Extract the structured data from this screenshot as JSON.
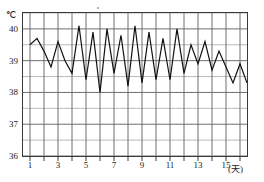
{
  "chart_data": {
    "type": "line",
    "title": "",
    "xlabel": "(天)",
    "ylabel": "℃",
    "x": [
      1,
      1.5,
      2,
      2.5,
      3,
      3.5,
      4,
      4.5,
      5,
      5.5,
      6,
      6.5,
      7,
      7.5,
      8,
      8.5,
      9,
      9.5,
      10,
      10.5,
      11,
      11.5,
      12,
      12.5,
      13,
      13.5,
      14,
      14.5,
      15,
      15.5,
      16,
      16.5
    ],
    "values": [
      39.5,
      39.7,
      39.3,
      38.8,
      39.6,
      39.0,
      38.6,
      40.1,
      38.4,
      39.9,
      38.0,
      40.0,
      38.6,
      39.8,
      38.2,
      40.1,
      38.3,
      39.9,
      38.4,
      39.7,
      38.4,
      40.0,
      38.6,
      39.5,
      38.9,
      39.6,
      38.7,
      39.3,
      38.8,
      38.3,
      38.9,
      38.3
    ],
    "ylim": [
      36,
      40.5
    ],
    "ymajor": [
      36,
      37,
      38,
      39,
      40
    ],
    "yminor_step": 0.5,
    "xlim": [
      0.5,
      16.5
    ],
    "xticks": [
      1,
      2,
      3,
      4,
      5,
      6,
      7,
      8,
      9,
      10,
      11,
      12,
      13,
      14,
      15,
      16
    ],
    "xtick_labels_shown": [
      {
        "x": 1,
        "label": "1"
      },
      {
        "x": 3,
        "label": "3"
      },
      {
        "x": 5,
        "label": "5"
      },
      {
        "x": 7,
        "label": "7"
      },
      {
        "x": 9,
        "label": "9"
      },
      {
        "x": 11,
        "label": "11"
      },
      {
        "x": 13,
        "label": "13"
      },
      {
        "x": 15,
        "label": "15"
      }
    ],
    "grid": true,
    "legend": "none",
    "line_color": "#111111",
    "grid_color": "#6f6f6f",
    "minor_grid_color": "#a8a8a8"
  }
}
